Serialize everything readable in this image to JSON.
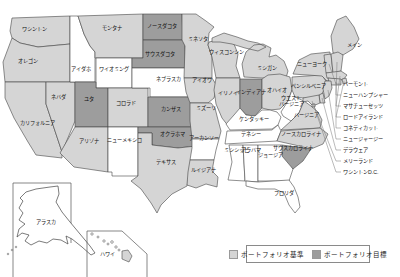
{
  "legend": {
    "items": [
      {
        "label": "ポートフォリオ基準",
        "color": "#d5d5d5"
      },
      {
        "label": "ポートフォリオ目標",
        "color": "#9d9d9d"
      }
    ]
  },
  "map": {
    "colors": {
      "base": "#d5d5d5",
      "target": "#9d9d9d",
      "none": "#ffffff",
      "border": "#444444",
      "label": "#111111"
    },
    "insets": {
      "alaska": {
        "label": "アラスカ",
        "status": "none"
      },
      "hawaii": {
        "label": "ハワイ",
        "status": "none"
      }
    },
    "states": [
      {
        "id": "WA",
        "label": "ワシントン",
        "status": "base"
      },
      {
        "id": "OR",
        "label": "オレゴン",
        "status": "base"
      },
      {
        "id": "CA",
        "label": "カリフォルニア",
        "status": "base"
      },
      {
        "id": "NV",
        "label": "ネバダ",
        "status": "base"
      },
      {
        "id": "ID",
        "label": "アイダホ",
        "status": "none"
      },
      {
        "id": "MT",
        "label": "モンタナ",
        "status": "base"
      },
      {
        "id": "WY",
        "label": "ワイオミング",
        "status": "none"
      },
      {
        "id": "UT",
        "label": "ユタ",
        "status": "target"
      },
      {
        "id": "CO",
        "label": "コロラド",
        "status": "base"
      },
      {
        "id": "AZ",
        "label": "アリゾナ",
        "status": "base"
      },
      {
        "id": "NM",
        "label": "ニューメキシコ",
        "status": "none"
      },
      {
        "id": "ND",
        "label": "ノースダコタ",
        "status": "target"
      },
      {
        "id": "SD",
        "label": "サウスダコタ",
        "status": "target"
      },
      {
        "id": "NE",
        "label": "ネブラスカ",
        "status": "none"
      },
      {
        "id": "KS",
        "label": "カンザス",
        "status": "target"
      },
      {
        "id": "OK",
        "label": "オクラホマ",
        "status": "target"
      },
      {
        "id": "TX",
        "label": "テキサス",
        "status": "base"
      },
      {
        "id": "MN",
        "label": "ミネソタ",
        "status": "base"
      },
      {
        "id": "IA",
        "label": "アイオワ",
        "status": "base"
      },
      {
        "id": "MO",
        "label": "ミズーリ",
        "status": "base"
      },
      {
        "id": "AR",
        "label": "アーカンソー",
        "status": "none"
      },
      {
        "id": "LA",
        "label": "ルイジアナ",
        "status": "base"
      },
      {
        "id": "WI",
        "label": "ウィスコンシン",
        "status": "base"
      },
      {
        "id": "IL",
        "label": "イリノイ",
        "status": "base"
      },
      {
        "id": "MI",
        "label": "ミシガン",
        "status": "base"
      },
      {
        "id": "IN",
        "label": "インディアナ",
        "status": "target"
      },
      {
        "id": "OH",
        "label": "オハイオ",
        "status": "base"
      },
      {
        "id": "KY",
        "label": "ケンタッキー",
        "status": "none"
      },
      {
        "id": "TN",
        "label": "テネシー",
        "status": "none"
      },
      {
        "id": "MS",
        "label": "ミシシッピ",
        "status": "none"
      },
      {
        "id": "AL",
        "label": "アラバマ",
        "status": "none"
      },
      {
        "id": "GA",
        "label": "ジョージア",
        "status": "none"
      },
      {
        "id": "FL",
        "label": "フロリダ",
        "status": "none"
      },
      {
        "id": "WV",
        "label": "ウエスト\nバージニア",
        "status": "none"
      },
      {
        "id": "VA",
        "label": "バージニア",
        "status": "base"
      },
      {
        "id": "NC",
        "label": "ノースカロライナ",
        "status": "base"
      },
      {
        "id": "SC",
        "label": "サウスカロライナ",
        "status": "target"
      },
      {
        "id": "PA",
        "label": "ペンシルベニア",
        "status": "base"
      },
      {
        "id": "NY",
        "label": "ニューヨーク",
        "status": "base"
      },
      {
        "id": "ME",
        "label": "メイン",
        "status": "base"
      },
      {
        "id": "VT",
        "label": "バーモント",
        "status": "base",
        "placement": "east"
      },
      {
        "id": "NH",
        "label": "ニューハンプシャー",
        "status": "base",
        "placement": "east"
      },
      {
        "id": "MA",
        "label": "マサチューセッツ",
        "status": "base",
        "placement": "east"
      },
      {
        "id": "RI",
        "label": "ロードアイランド",
        "status": "base",
        "placement": "east"
      },
      {
        "id": "CT",
        "label": "コネティカット",
        "status": "base",
        "placement": "east"
      },
      {
        "id": "NJ",
        "label": "ニュージャージー",
        "status": "base",
        "placement": "east"
      },
      {
        "id": "DE",
        "label": "デラウェア",
        "status": "base",
        "placement": "east"
      },
      {
        "id": "MD",
        "label": "メリーランド",
        "status": "base",
        "placement": "east"
      },
      {
        "id": "DC",
        "label": "ワシントンD.C.",
        "status": "base",
        "placement": "east"
      }
    ]
  }
}
